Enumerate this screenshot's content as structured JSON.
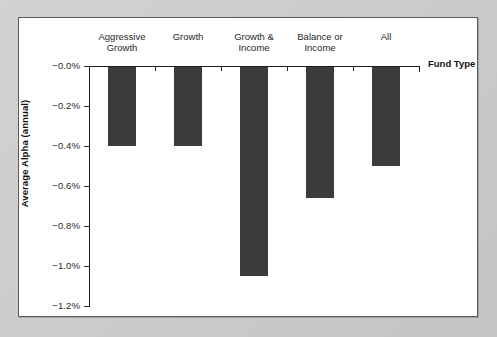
{
  "chart_data": {
    "type": "bar",
    "title": "",
    "subtitle": "",
    "xlabel": "Fund Type",
    "ylabel": "Average Alpha (annual)",
    "categories": [
      "Aggressive\nGrowth",
      "Growth",
      "Growth &\nIncome",
      "Balance or\nIncome",
      "All"
    ],
    "category_names": [
      "Aggressive Growth",
      "Growth",
      "Growth & Income",
      "Balance or Income",
      "All"
    ],
    "values": [
      -0.4,
      -0.4,
      -1.05,
      -0.66,
      -0.5
    ],
    "value_labels": [
      "-0.40%",
      "-0.40%",
      "-1.05%",
      "-0.66%",
      "-0.50%"
    ],
    "ylim": [
      -1.2,
      0.0
    ],
    "yticks": [
      0.0,
      -0.2,
      -0.4,
      -0.6,
      -0.8,
      -1.0,
      -1.2
    ],
    "ytick_labels": [
      "−0.0%",
      "−0.2%",
      "−0.4%",
      "−0.6%",
      "−0.8%",
      "−1.0%",
      "−1.2%"
    ],
    "grid": false,
    "legend": false,
    "legend_position": "none",
    "bar_color": "#3b3b3b",
    "axis_color": "#1c1c1c",
    "background_color": "#ffffff",
    "frame_color": "#c9c9c9"
  }
}
